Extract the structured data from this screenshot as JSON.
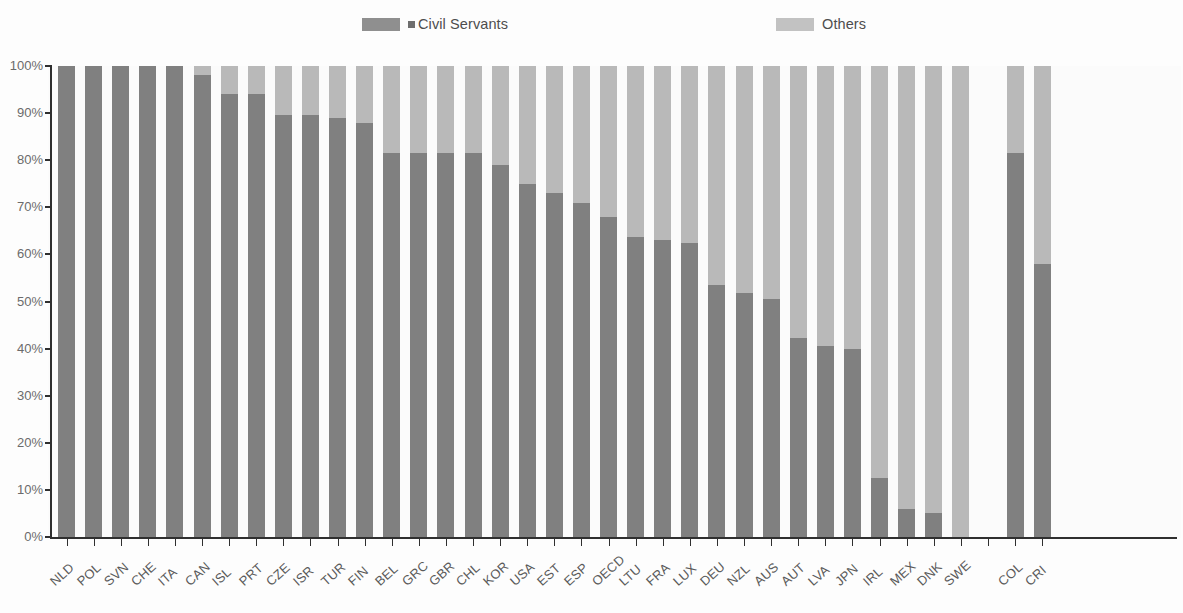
{
  "legend": {
    "items": [
      {
        "label": "Civil Servants",
        "color": "#808080",
        "marker": "square-swatch"
      },
      {
        "label": "Others",
        "color": "#b9b9b9",
        "marker": "square-swatch"
      }
    ]
  },
  "axis": {
    "y_ticks": [
      "100%",
      "90%",
      "80%",
      "70%",
      "60%",
      "50%",
      "40%",
      "30%",
      "20%",
      "10%",
      "0%"
    ],
    "y_min": 0,
    "y_max": 100
  },
  "chart_data": {
    "type": "bar",
    "subtype": "stacked-percentage",
    "title": "",
    "subtitle": "",
    "xlabel": "",
    "ylabel": "",
    "ylim": [
      0,
      100
    ],
    "ytick_labels": [
      "0%",
      "10%",
      "20%",
      "30%",
      "40%",
      "50%",
      "60%",
      "70%",
      "80%",
      "90%",
      "100%"
    ],
    "grid": false,
    "legend_position": "top",
    "categories": [
      "NLD",
      "POL",
      "SVN",
      "CHE",
      "ITA",
      "CAN",
      "ISL",
      "PRT",
      "CZE",
      "ISR",
      "TUR",
      "FIN",
      "BEL",
      "GRC",
      "GBR",
      "CHL",
      "KOR",
      "USA",
      "EST",
      "ESP",
      "OECD",
      "LTU",
      "FRA",
      "LUX",
      "DEU",
      "NZL",
      "AUS",
      "AUT",
      "LVA",
      "JPN",
      "IRL",
      "MEX",
      "DNK",
      "SWE",
      "",
      "COL",
      "CRI"
    ],
    "series": [
      {
        "name": "Civil Servants",
        "color": "#808080",
        "values": [
          100,
          100,
          100,
          100,
          100,
          98,
          94,
          94,
          89.5,
          89.5,
          89,
          88,
          81.5,
          81.5,
          81.5,
          81.5,
          79,
          75,
          73,
          71,
          68,
          63.8,
          63,
          62.5,
          53.5,
          51.8,
          50.6,
          42.2,
          40.5,
          40,
          12.5,
          6,
          5,
          0,
          null,
          81.5,
          58
        ]
      },
      {
        "name": "Others",
        "color": "#b9b9b9",
        "values": [
          0,
          0,
          0,
          0,
          0,
          2,
          6,
          6,
          10.5,
          10.5,
          11,
          12,
          18.5,
          18.5,
          18.5,
          18.5,
          21,
          25,
          27,
          29,
          32,
          36.2,
          37,
          37.5,
          46.5,
          48.2,
          49.4,
          57.8,
          59.5,
          60,
          87.5,
          94,
          95,
          100,
          null,
          18.5,
          42
        ]
      }
    ]
  }
}
